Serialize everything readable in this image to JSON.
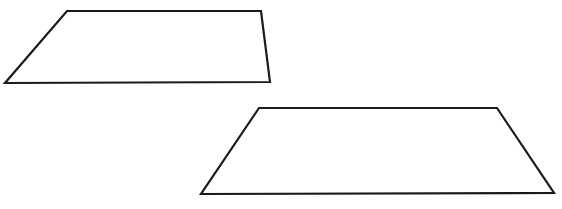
{
  "diagram": {
    "canvas": {
      "width": 562,
      "height": 209,
      "background": "#ffffff"
    },
    "stroke_color": "#1a1a1a",
    "shapes": [
      {
        "name": "quadrilateral-1",
        "type": "trapezoid",
        "points": "67,11 261,11 270,82 5,83"
      },
      {
        "name": "quadrilateral-2",
        "type": "trapezoid",
        "points": "259,108 497,108 554,193 201,194"
      }
    ]
  }
}
